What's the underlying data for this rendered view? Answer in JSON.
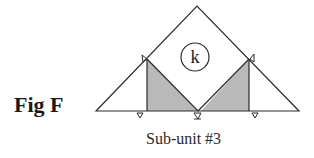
{
  "figure": {
    "label": "Fig F",
    "caption": "Sub-unit #3",
    "circle_label": "k"
  },
  "colors": {
    "line": "#2b2b2b",
    "shade": "#b9b9b9",
    "background": "#ffffff"
  }
}
